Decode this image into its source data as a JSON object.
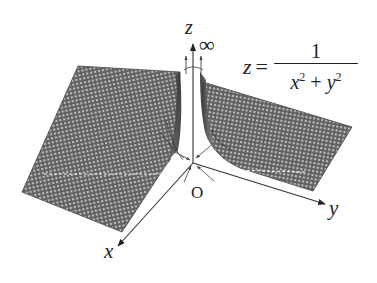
{
  "figure": {
    "type": "3d-surface-plot",
    "surface": "z = 1/(x^2 + y^2)",
    "axes": {
      "x_label": "x",
      "y_label": "y",
      "z_label": "z"
    },
    "origin_label": "O",
    "infinity_label": "∞",
    "formula": {
      "lhs": "z",
      "eq": "=",
      "numerator": "1",
      "denominator_x": "x",
      "denominator_plus": " + ",
      "denominator_y": "y",
      "exp": "2"
    },
    "colors": {
      "mesh": "#5a5a5a",
      "mesh_light": "#d8d8d8",
      "axis": "#333333",
      "background": "#ffffff"
    }
  }
}
